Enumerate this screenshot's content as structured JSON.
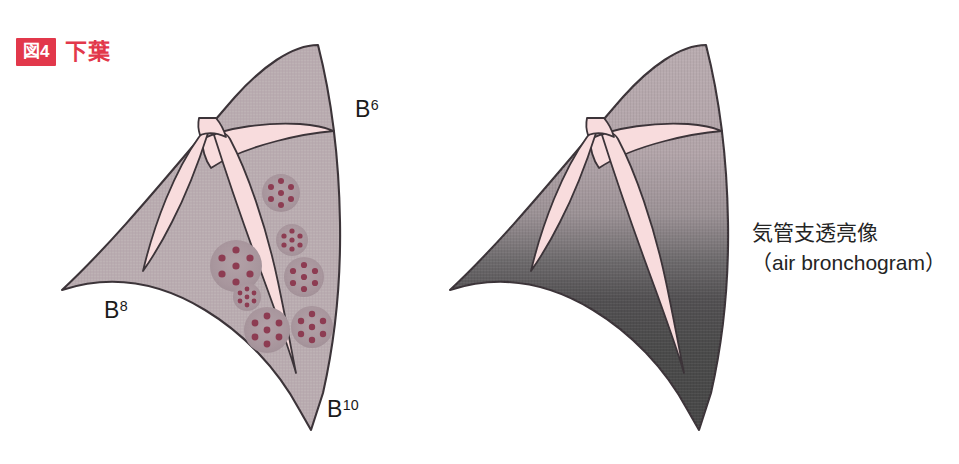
{
  "figure": {
    "badge_label": "図4",
    "caption": "下葉",
    "badge_color": "#e2384b",
    "caption_color": "#e2384b"
  },
  "palette": {
    "lung_fill": "#b9acb0",
    "lung_outline": "#3c3439",
    "bronchus_fill": "#f8dcdd",
    "bronchus_outline": "#3c3439",
    "nodule_fill": "#ab9aa0",
    "nodule_dot": "#8d3c52",
    "consolidation_top": "#b9acb0",
    "consolidation_bottom": "#4a4a4a",
    "background": "#ffffff"
  },
  "panels": [
    {
      "id": "left-panel",
      "name": "nodular-pattern-lower-lobe",
      "labels": [
        {
          "id": "b6",
          "base": "B",
          "sup": "6"
        },
        {
          "id": "b8",
          "base": "B",
          "sup": "8"
        },
        {
          "id": "b10",
          "base": "B",
          "sup": "10"
        }
      ],
      "nodule_count": 7,
      "nodules": [
        {
          "cx": 281,
          "cy": 193,
          "r": 19
        },
        {
          "cx": 236,
          "cy": 266,
          "r": 26
        },
        {
          "cx": 292,
          "cy": 240,
          "r": 16
        },
        {
          "cx": 304,
          "cy": 277,
          "r": 20
        },
        {
          "cx": 247,
          "cy": 297,
          "r": 14
        },
        {
          "cx": 267,
          "cy": 330,
          "r": 23
        },
        {
          "cx": 312,
          "cy": 327,
          "r": 21
        }
      ]
    },
    {
      "id": "right-panel",
      "name": "consolidation-lower-lobe",
      "annotation_line1": "気管支透亮像",
      "annotation_line2": "（air bronchogram）"
    }
  ]
}
